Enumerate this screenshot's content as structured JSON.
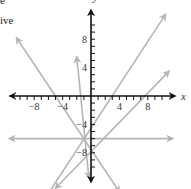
{
  "text_fragments": [
    "e",
    "ive"
  ],
  "chart_data": {
    "type": "line",
    "title": "",
    "xlabel": "x",
    "ylabel": "y",
    "xlim": [
      -11,
      11
    ],
    "ylim": [
      -11,
      11
    ],
    "grid": false,
    "x_tick_labels": [
      "-8",
      "-4",
      "4",
      "8"
    ],
    "y_tick_labels": [
      "8",
      "4",
      "-4",
      "-8"
    ],
    "tick_interval": 1,
    "common_point": [
      -1,
      -6
    ],
    "lines_color": "#b5b5b5",
    "axis_color": "#111111",
    "series": [
      {
        "name": "line-horizontal",
        "slope": 0,
        "through": [
          -1,
          -6
        ],
        "endpoints": [
          [
            -11.5,
            -6
          ],
          [
            11.5,
            -6
          ]
        ]
      },
      {
        "name": "line-steep-up-left",
        "slope": -11,
        "through": [
          -1,
          -6
        ],
        "endpoints": [
          [
            -2,
            5.5
          ],
          [
            -0.3,
            -11.5
          ]
        ]
      },
      {
        "name": "line-up-left",
        "slope": -1.6,
        "through": [
          -1,
          -6
        ],
        "endpoints": [
          [
            -10.5,
            8.2
          ],
          [
            4,
            -13.5
          ]
        ]
      },
      {
        "name": "line-up-right-steep",
        "slope": 1.5,
        "through": [
          -1,
          -6
        ],
        "endpoints": [
          [
            10.5,
            11.5
          ],
          [
            -7.5,
            -16
          ]
        ]
      },
      {
        "name": "line-up-right-shallow",
        "slope": 0.8,
        "through": [
          -1,
          -6
        ],
        "endpoints": [
          [
            11,
            3.5
          ],
          [
            -5,
            -13
          ]
        ]
      }
    ]
  }
}
